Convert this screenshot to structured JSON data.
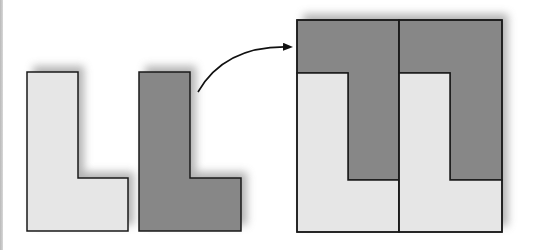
{
  "diagram": {
    "colors": {
      "light_fill": "#e6e6e6",
      "dark_fill": "#878787",
      "stroke": "#1a1a1a",
      "shadow": "#9a9a9a",
      "arrow": "#111111",
      "background": "#ffffff"
    },
    "shapes": [
      {
        "id": "light-l",
        "label": "",
        "fill": "light",
        "points": [
          [
            27,
            72
          ],
          [
            78,
            72
          ],
          [
            78,
            178
          ],
          [
            128,
            178
          ],
          [
            128,
            231
          ],
          [
            27,
            231
          ]
        ]
      },
      {
        "id": "dark-l",
        "label": "",
        "fill": "dark",
        "points": [
          [
            139,
            72
          ],
          [
            190,
            72
          ],
          [
            190,
            178
          ],
          [
            241,
            178
          ],
          [
            241,
            231
          ],
          [
            139,
            231
          ]
        ]
      }
    ],
    "composite": {
      "bounds": {
        "x": 297,
        "y": 20,
        "width": 205,
        "height": 212
      },
      "divider_x": 399,
      "cells": [
        {
          "dark_points": [
            [
              297,
              20
            ],
            [
              399,
              20
            ],
            [
              399,
              180
            ],
            [
              348,
              180
            ],
            [
              348,
              73
            ],
            [
              297,
              73
            ]
          ],
          "light_points": [
            [
              297,
              73
            ],
            [
              348,
              73
            ],
            [
              348,
              180
            ],
            [
              399,
              180
            ],
            [
              399,
              232
            ],
            [
              297,
              232
            ]
          ]
        },
        {
          "dark_points": [
            [
              399,
              20
            ],
            [
              502,
              20
            ],
            [
              502,
              180
            ],
            [
              450,
              180
            ],
            [
              450,
              73
            ],
            [
              399,
              73
            ]
          ],
          "light_points": [
            [
              399,
              73
            ],
            [
              450,
              73
            ],
            [
              450,
              180
            ],
            [
              502,
              180
            ],
            [
              502,
              232
            ],
            [
              399,
              232
            ]
          ]
        }
      ]
    },
    "arrow": {
      "from": [
        198,
        92
      ],
      "control": [
        225,
        45
      ],
      "to": [
        292,
        47
      ],
      "icon": "curved-arrow-icon"
    }
  }
}
